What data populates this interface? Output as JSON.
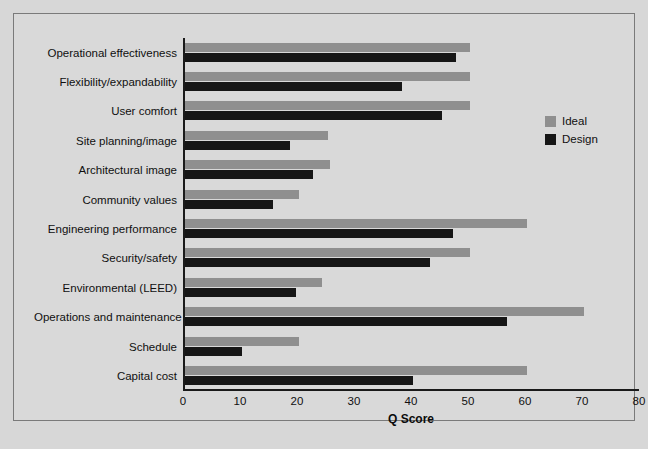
{
  "chart_data": {
    "type": "bar",
    "orientation": "horizontal",
    "title": "",
    "xlabel": "Q Score",
    "ylabel": "",
    "xlim": [
      0,
      80
    ],
    "xticks": [
      0,
      10,
      20,
      30,
      40,
      50,
      60,
      70,
      80
    ],
    "grid": false,
    "legend_position": "right",
    "categories": [
      "Operational effectiveness",
      "Flexibility/expandability",
      "User comfort",
      "Site planning/image",
      "Architectural image",
      "Community values",
      "Engineering performance",
      "Security/safety",
      "Environmental (LEED)",
      "Operations and maintenance",
      "Schedule",
      "Capital cost"
    ],
    "series": [
      {
        "name": "Ideal",
        "color": "#8f8f8f",
        "values": [
          50,
          50,
          50,
          25,
          25.5,
          20,
          60,
          50,
          24,
          70,
          20,
          60
        ]
      },
      {
        "name": "Design",
        "color": "#161616",
        "values": [
          47.5,
          38,
          45,
          18.5,
          22.5,
          15.5,
          47,
          43,
          19.5,
          56.5,
          10,
          40
        ]
      }
    ]
  },
  "legend": {
    "items": [
      {
        "label": "Ideal",
        "color": "#8f8f8f"
      },
      {
        "label": "Design",
        "color": "#161616"
      }
    ]
  },
  "axis": {
    "x_label": "Q Score",
    "tick_labels": [
      "0",
      "10",
      "20",
      "30",
      "40",
      "50",
      "60",
      "70",
      "80"
    ]
  }
}
